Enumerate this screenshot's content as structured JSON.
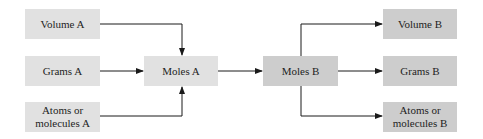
{
  "diagram": {
    "type": "flowchart",
    "colors": {
      "source_box": "#e1e1e1",
      "target_box": "#cdcdcd",
      "arrow": "#1a1a1a"
    },
    "nodes": {
      "volume_a": "Volume A",
      "grams_a": "Grams A",
      "atoms_a_line1": "Atoms or",
      "atoms_a_line2": "molecules A",
      "moles_a": "Moles A",
      "moles_b": "Moles B",
      "volume_b": "Volume B",
      "grams_b": "Grams B",
      "atoms_b_line1": "Atoms or",
      "atoms_b_line2": "molecules B"
    },
    "edges": [
      {
        "from": "Volume A",
        "to": "Moles A"
      },
      {
        "from": "Grams A",
        "to": "Moles A"
      },
      {
        "from": "Atoms or molecules A",
        "to": "Moles A"
      },
      {
        "from": "Moles A",
        "to": "Moles B"
      },
      {
        "from": "Moles B",
        "to": "Volume B"
      },
      {
        "from": "Moles B",
        "to": "Grams B"
      },
      {
        "from": "Moles B",
        "to": "Atoms or molecules B"
      }
    ]
  }
}
